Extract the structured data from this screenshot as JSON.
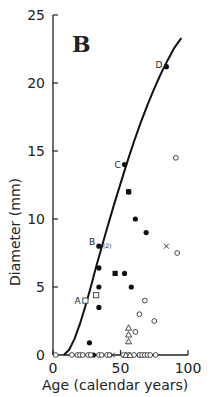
{
  "chart_data": {
    "type": "scatter",
    "panel_label": "B",
    "title": "",
    "xlabel": "Age (calendar years)",
    "ylabel": "Diameter (mm)",
    "xlim": [
      0,
      100
    ],
    "ylim": [
      0,
      25
    ],
    "xticks": [
      0,
      50,
      100
    ],
    "yticks": [
      0,
      5,
      10,
      15,
      20,
      25
    ],
    "grid": false,
    "curve": {
      "name": "growth curve",
      "x": [
        8,
        12,
        16,
        20,
        24,
        28,
        32,
        36,
        40,
        45,
        50,
        55,
        60,
        65,
        70,
        75,
        80,
        85,
        90,
        95
      ],
      "y": [
        0,
        0.4,
        1.2,
        2.3,
        3.6,
        5.0,
        6.5,
        7.9,
        9.3,
        11.0,
        12.6,
        14.2,
        15.7,
        17.1,
        18.4,
        19.6,
        20.7,
        21.7,
        22.6,
        23.3
      ]
    },
    "labeled_points": [
      {
        "label": "A",
        "x": 24,
        "y": 4.0,
        "marker": "open-square"
      },
      {
        "label": "B",
        "x": 34,
        "y": 8.0,
        "marker": "filled-circle",
        "note": "(2)"
      },
      {
        "label": "C",
        "x": 53,
        "y": 14.0,
        "marker": "filled-circle"
      },
      {
        "label": "D",
        "x": 84,
        "y": 21.2,
        "marker": "filled-circle"
      }
    ],
    "series": [
      {
        "name": "filled circles",
        "marker": "filled-circle",
        "x": [
          56,
          61,
          69,
          34,
          53,
          58,
          34,
          34,
          27,
          30,
          64
        ],
        "y": [
          12,
          10,
          9,
          6.4,
          6,
          5,
          5,
          3.5,
          0.9,
          0,
          0
        ]
      },
      {
        "name": "filled squares",
        "marker": "filled-square",
        "x": [
          56,
          46
        ],
        "y": [
          12,
          6
        ]
      },
      {
        "name": "open squares",
        "marker": "open-square",
        "x": [
          32
        ],
        "y": [
          4.4
        ]
      },
      {
        "name": "open circles",
        "marker": "open-circle",
        "x": [
          91,
          92,
          68,
          64,
          75,
          61,
          2,
          14,
          18,
          20,
          22,
          26,
          28,
          34,
          36,
          40,
          42,
          52,
          56,
          60,
          64,
          66,
          68,
          70,
          72,
          76
        ],
        "y": [
          14.5,
          7.5,
          4,
          3,
          2.5,
          1.7,
          0,
          0,
          0,
          0,
          0,
          0,
          0,
          0,
          0,
          0,
          0,
          0,
          0,
          0,
          0,
          0,
          0,
          0,
          0,
          0
        ]
      },
      {
        "name": "open triangles",
        "marker": "open-triangle",
        "x": [
          56,
          56,
          56,
          54,
          57
        ],
        "y": [
          2,
          1.5,
          1,
          0,
          0
        ]
      },
      {
        "name": "crosses",
        "marker": "cross",
        "x": [
          84,
          44
        ],
        "y": [
          8,
          0
        ]
      }
    ]
  },
  "labels": {
    "panel": "B",
    "xlabel": "Age (calendar years)",
    "ylabel": "Diameter (mm)",
    "point_a": "A",
    "point_b": "B",
    "point_b_note": "(2)",
    "point_c": "C",
    "point_d": "D"
  }
}
